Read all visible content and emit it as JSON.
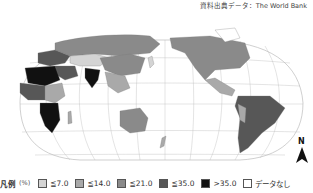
{
  "header": {
    "source_label": "資料出典データ：The World Bank"
  },
  "map": {
    "projection": "world map (Pacific-centered, curved graticule)",
    "graticule_labels": [
      "120°E",
      "150°E 180°",
      "60°N",
      "30°N",
      "0°",
      "30°S",
      "60°S",
      "150°W",
      "120°W",
      "90°W",
      "60°W",
      "30°W"
    ],
    "colors": {
      "le7": "#d4d4d4",
      "le14": "#a9a9a9",
      "le21": "#8a8a8a",
      "le35": "#575757",
      "gt35": "#111111",
      "nodata": "#ffffff",
      "grid": "#b0b0b0",
      "coast": "#777777"
    }
  },
  "north_arrow": {
    "label": "N"
  },
  "legend": {
    "title": "凡例",
    "unit": "(%)",
    "items": [
      {
        "label": "≦7.0",
        "color": "#d4d4d4"
      },
      {
        "label": "≦14.0",
        "color": "#a9a9a9"
      },
      {
        "label": "≦21.0",
        "color": "#8a8a8a"
      },
      {
        "label": "≦35.0",
        "color": "#575757"
      },
      {
        "label": ">35.0",
        "color": "#111111"
      },
      {
        "label": "データなし",
        "color": "#ffffff"
      }
    ]
  }
}
